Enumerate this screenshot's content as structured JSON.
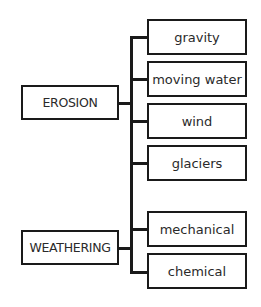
{
  "diagram": {
    "type": "tree",
    "roots": [
      {
        "label": "EROSION",
        "children": [
          "gravity",
          "moving water",
          "wind",
          "glaciers"
        ]
      },
      {
        "label": "WEATHERING",
        "children": [
          "mechanical",
          "chemical"
        ]
      }
    ],
    "nodes": {
      "erosion": "EROSION",
      "weathering": "WEATHERING",
      "gravity": "gravity",
      "moving_water": "moving water",
      "wind": "wind",
      "glaciers": "glaciers",
      "mechanical": "mechanical",
      "chemical": "chemical"
    },
    "colors": {
      "stroke": "#1a1a1a",
      "text": "#2a2a2a",
      "background": "#ffffff"
    }
  }
}
